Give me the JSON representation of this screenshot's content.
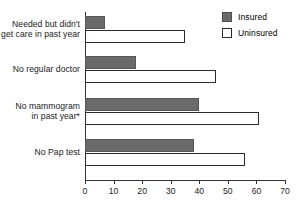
{
  "chart_data": {
    "type": "bar",
    "orientation": "horizontal",
    "title": "",
    "subtitle": "",
    "xlabel": "",
    "ylabel": "",
    "xlim": [
      0,
      70
    ],
    "xticks": [
      0,
      10,
      20,
      30,
      40,
      50,
      60,
      70
    ],
    "grid": false,
    "legend_position": "top-right",
    "categories": [
      "Needed but didn't\nget care in past year",
      "No regular doctor",
      "No mammogram\nin past year*",
      "No Pap test"
    ],
    "category_lines": [
      [
        "Needed but didn't",
        "get care in past year"
      ],
      [
        "No regular doctor"
      ],
      [
        "No mammogram",
        "in past year*"
      ],
      [
        "No Pap test"
      ]
    ],
    "series": [
      {
        "name": "Insured",
        "color": "#6a6a6a",
        "border": "#555555",
        "values": [
          7,
          18,
          40,
          38
        ]
      },
      {
        "name": "Uninsured",
        "color": "#ffffff",
        "border": "#2b2b2b",
        "values": [
          35,
          46,
          61,
          56
        ]
      }
    ]
  },
  "legend": {
    "items": [
      {
        "label": "Insured",
        "swatch": "filled-square-icon"
      },
      {
        "label": "Uninsured",
        "swatch": "hollow-square-icon"
      }
    ]
  },
  "axis": {
    "x_tick_labels": [
      "0",
      "10",
      "20",
      "30",
      "40",
      "50",
      "60",
      "70"
    ]
  }
}
